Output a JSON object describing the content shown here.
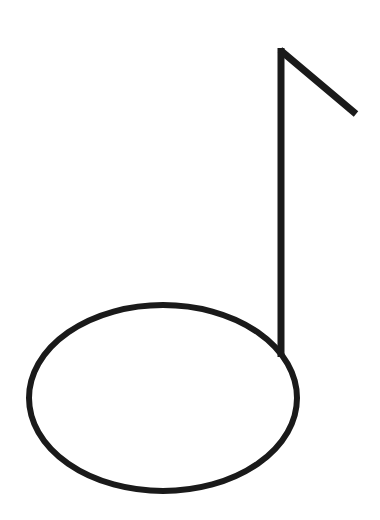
{
  "figure": {
    "subject": "eighth music note",
    "icon": "music-note-icon",
    "stroke_color": "#1a1a1a",
    "background_color": "#ffffff",
    "note_head": {
      "cx": 163,
      "cy": 398,
      "rx": 134,
      "ry": 93
    },
    "stem": {
      "x": 281,
      "y_top": 48,
      "y_bottom": 356
    },
    "flag": {
      "x1": 281,
      "y1": 50,
      "x2": 356,
      "y2": 114
    }
  }
}
